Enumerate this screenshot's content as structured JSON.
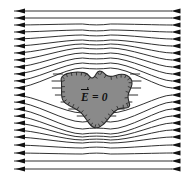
{
  "figure": {
    "background_color": "#ffffff",
    "width": 186,
    "height": 181
  },
  "conductor": {
    "name": "conductor-blob",
    "fill_color": "#8a8a8a",
    "outline_color": "#2a2a2a",
    "label_text": "E = 0",
    "label_symbol": "E",
    "label_operator": "=",
    "label_value": "0",
    "label_has_vector_arrow": true,
    "description": "irregular shaded conducting body with zero interior field"
  },
  "field": {
    "name": "uniform-external-field",
    "direction": "left-to-right",
    "line_color": "#1a1a1a",
    "arrow_color": "#121212",
    "line_count": 22,
    "arrowheads_left": true,
    "arrowheads_right": true
  },
  "chart_data": {
    "type": "line",
    "xlabel": "",
    "ylabel": "",
    "xlim": [
      0,
      186
    ],
    "ylim": [
      0,
      181
    ],
    "grid": false,
    "legend": null,
    "annotations": [
      {
        "text": "E = 0",
        "x": 98,
        "y": 99,
        "vector_arrow": true
      }
    ],
    "series": [
      {
        "name": "field-line-1",
        "y_left": 11,
        "y_right": 11,
        "deflection": 0
      },
      {
        "name": "field-line-2",
        "y_left": 18,
        "y_right": 18,
        "deflection": 0
      },
      {
        "name": "field-line-3",
        "y_left": 25,
        "y_right": 25,
        "deflection": -1
      },
      {
        "name": "field-line-4",
        "y_left": 32,
        "y_right": 32,
        "deflection": -2
      },
      {
        "name": "field-line-5",
        "y_left": 39,
        "y_right": 39,
        "deflection": -4
      },
      {
        "name": "field-line-6",
        "y_left": 46,
        "y_right": 46,
        "deflection": -6
      },
      {
        "name": "field-line-7",
        "y_left": 53,
        "y_right": 53,
        "deflection": -9
      },
      {
        "name": "field-line-8",
        "y_left": 60,
        "y_right": 60,
        "deflection": -12
      },
      {
        "name": "field-line-9",
        "y_left": 67,
        "y_right": 67,
        "deflection": -14
      },
      {
        "name": "field-line-10",
        "y_left": 74,
        "y_right": 74,
        "deflection": -16
      },
      {
        "name": "field-line-11",
        "y_left": 81,
        "y_right": 81,
        "deflection": -18
      },
      {
        "name": "field-line-12",
        "y_left": 88,
        "y_right": 88,
        "deflection": -20
      },
      {
        "name": "field-line-13",
        "y_left": 95,
        "y_right": 95,
        "deflection": 18
      },
      {
        "name": "field-line-14",
        "y_left": 102,
        "y_right": 102,
        "deflection": 20
      },
      {
        "name": "field-line-15",
        "y_left": 109,
        "y_right": 109,
        "deflection": 20
      },
      {
        "name": "field-line-16",
        "y_left": 116,
        "y_right": 116,
        "deflection": 18
      },
      {
        "name": "field-line-17",
        "y_left": 123,
        "y_right": 123,
        "deflection": 14
      },
      {
        "name": "field-line-18",
        "y_left": 130,
        "y_right": 130,
        "deflection": 10
      },
      {
        "name": "field-line-19",
        "y_left": 137,
        "y_right": 137,
        "deflection": 6
      },
      {
        "name": "field-line-20",
        "y_left": 145,
        "y_right": 145,
        "deflection": 3
      },
      {
        "name": "field-line-21",
        "y_left": 153,
        "y_right": 153,
        "deflection": 1
      },
      {
        "name": "field-line-22",
        "y_left": 161,
        "y_right": 161,
        "deflection": 0
      },
      {
        "name": "field-line-23",
        "y_left": 169,
        "y_right": 169,
        "deflection": 0
      }
    ]
  }
}
